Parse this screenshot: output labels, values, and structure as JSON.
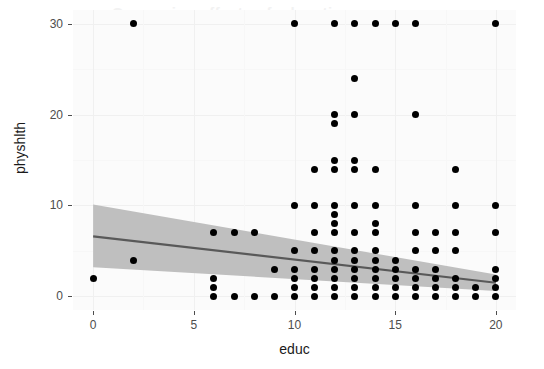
{
  "chart_data": {
    "type": "scatter",
    "title": "",
    "xlabel": "educ",
    "ylabel": "physhlth",
    "xlim": [
      -1,
      21
    ],
    "ylim": [
      -1.5,
      31.5
    ],
    "xticks": [
      0,
      5,
      10,
      15,
      20
    ],
    "yticks": [
      0,
      10,
      20,
      30
    ],
    "grid": true,
    "legend": null,
    "point_color": "#000000",
    "line_color": "#595959",
    "ribbon_color": "#bfbfbf",
    "panel_background": "#fbfbfb",
    "points": [
      [
        0,
        2
      ],
      [
        2,
        30
      ],
      [
        2,
        4
      ],
      [
        6,
        0
      ],
      [
        6,
        1
      ],
      [
        6,
        2
      ],
      [
        6,
        7
      ],
      [
        7,
        0
      ],
      [
        7,
        7
      ],
      [
        8,
        0
      ],
      [
        8,
        7
      ],
      [
        9,
        0
      ],
      [
        9,
        3
      ],
      [
        10,
        30
      ],
      [
        10,
        10
      ],
      [
        10,
        0
      ],
      [
        10,
        1
      ],
      [
        10,
        2
      ],
      [
        10,
        3
      ],
      [
        10,
        5
      ],
      [
        11,
        0
      ],
      [
        11,
        1
      ],
      [
        11,
        2
      ],
      [
        11,
        3
      ],
      [
        11,
        5
      ],
      [
        11,
        7
      ],
      [
        11,
        10
      ],
      [
        11,
        14
      ],
      [
        12,
        30
      ],
      [
        12,
        20
      ],
      [
        12,
        19
      ],
      [
        12,
        15
      ],
      [
        12,
        14
      ],
      [
        12,
        10
      ],
      [
        12,
        9
      ],
      [
        12,
        8
      ],
      [
        12,
        7
      ],
      [
        12,
        5
      ],
      [
        12,
        4
      ],
      [
        12,
        3
      ],
      [
        12,
        2
      ],
      [
        12,
        1
      ],
      [
        12,
        0
      ],
      [
        13,
        30
      ],
      [
        13,
        24
      ],
      [
        13,
        20
      ],
      [
        13,
        15
      ],
      [
        13,
        14
      ],
      [
        13,
        10
      ],
      [
        13,
        7
      ],
      [
        13,
        5
      ],
      [
        13,
        4
      ],
      [
        13,
        3
      ],
      [
        13,
        2
      ],
      [
        13,
        1
      ],
      [
        13,
        0
      ],
      [
        14,
        30
      ],
      [
        14,
        14
      ],
      [
        14,
        10
      ],
      [
        14,
        8
      ],
      [
        14,
        7
      ],
      [
        14,
        5
      ],
      [
        14,
        4
      ],
      [
        14,
        3
      ],
      [
        14,
        2
      ],
      [
        14,
        1
      ],
      [
        14,
        0
      ],
      [
        15,
        30
      ],
      [
        15,
        4
      ],
      [
        15,
        3
      ],
      [
        15,
        2
      ],
      [
        15,
        1
      ],
      [
        15,
        0
      ],
      [
        16,
        30
      ],
      [
        16,
        20
      ],
      [
        16,
        10
      ],
      [
        16,
        7
      ],
      [
        16,
        5
      ],
      [
        16,
        3
      ],
      [
        16,
        2
      ],
      [
        16,
        1
      ],
      [
        16,
        0
      ],
      [
        17,
        7
      ],
      [
        17,
        5
      ],
      [
        17,
        3
      ],
      [
        17,
        2
      ],
      [
        17,
        1
      ],
      [
        17,
        0
      ],
      [
        18,
        14
      ],
      [
        18,
        10
      ],
      [
        18,
        7
      ],
      [
        18,
        5
      ],
      [
        18,
        2
      ],
      [
        18,
        1
      ],
      [
        18,
        0
      ],
      [
        19,
        1
      ],
      [
        19,
        0
      ],
      [
        20,
        30
      ],
      [
        20,
        10
      ],
      [
        20,
        7
      ],
      [
        20,
        3
      ],
      [
        20,
        2
      ],
      [
        20,
        1
      ],
      [
        20,
        0
      ]
    ],
    "fit_line": {
      "x": [
        0,
        20
      ],
      "y": [
        6.6,
        1.5
      ]
    },
    "confidence_band": {
      "x": [
        0,
        20
      ],
      "upper": [
        10.1,
        2.4
      ],
      "lower": [
        3.2,
        0.6
      ]
    }
  },
  "axes": {
    "y_tick_labels": [
      "0",
      "10",
      "20",
      "30"
    ],
    "x_tick_labels": [
      "0",
      "5",
      "10",
      "15",
      "20"
    ],
    "x_title": "educ",
    "y_title": "physhlth"
  },
  "artifacts": {
    "ghost_text": "Comparing effects of education"
  }
}
